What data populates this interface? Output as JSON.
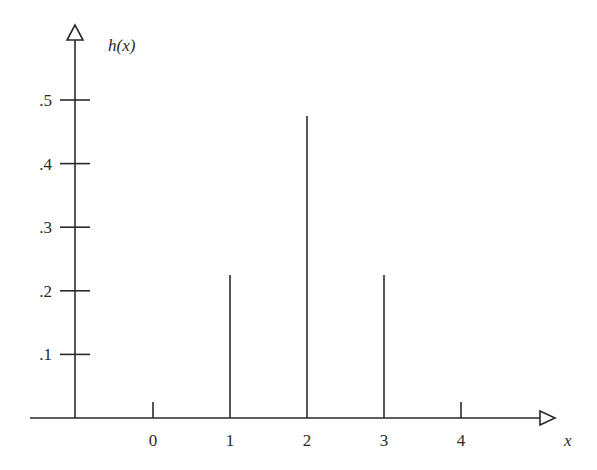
{
  "chart_data": {
    "type": "bar",
    "style": "stem",
    "title": "",
    "xlabel": "x",
    "ylabel": "h(x)",
    "categories": [
      "0",
      "1",
      "2",
      "3",
      "4"
    ],
    "x": [
      0,
      1,
      2,
      3,
      4
    ],
    "values": [
      0.025,
      0.225,
      0.475,
      0.225,
      0.025
    ],
    "yticks": [
      ".1",
      ".2",
      ".3",
      ".4",
      ".5"
    ],
    "ytick_values": [
      0.1,
      0.2,
      0.3,
      0.4,
      0.5
    ],
    "xticks": [
      "0",
      "1",
      "2",
      "3",
      "4"
    ],
    "ylim": [
      0,
      0.55
    ],
    "grid": false,
    "legend": null
  },
  "axes": {
    "y_label": "h(x)",
    "x_label": "x"
  }
}
